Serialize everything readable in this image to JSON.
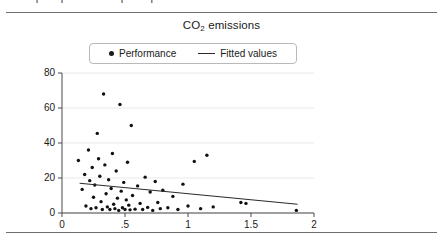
{
  "document": {
    "clipped_header_text": "· ·/ ·|2 · | · 2 · ·2    ·|2 - ·|2 · 2 · 2 2 · 4"
  },
  "chart_data": {
    "type": "scatter",
    "title": "CO2 emissions",
    "title_main": "CO",
    "title_sub": "2",
    "title_tail": " emissions",
    "xlabel": "",
    "ylabel": "",
    "xlim": [
      0,
      2
    ],
    "ylim": [
      0,
      80
    ],
    "grid": "horizontal",
    "legend_position": "top-center",
    "xticks": [
      0,
      0.5,
      1,
      1.5,
      2
    ],
    "xticklabels": [
      "0",
      ".5",
      "1",
      "1.5",
      "2"
    ],
    "yticks": [
      0,
      20,
      40,
      60,
      80
    ],
    "yticklabels": [
      "0",
      "20",
      "40",
      "60",
      "80"
    ],
    "series": [
      {
        "name": "Performance",
        "type": "scatter",
        "marker": "circle",
        "color": "#111111",
        "points": [
          [
            0.13,
            30.0
          ],
          [
            0.16,
            13.5
          ],
          [
            0.18,
            22.0
          ],
          [
            0.19,
            4.0
          ],
          [
            0.21,
            36.0
          ],
          [
            0.22,
            18.5
          ],
          [
            0.23,
            2.5
          ],
          [
            0.24,
            26.0
          ],
          [
            0.25,
            9.0
          ],
          [
            0.26,
            16.0
          ],
          [
            0.27,
            3.0
          ],
          [
            0.28,
            45.5
          ],
          [
            0.29,
            31.0
          ],
          [
            0.3,
            21.0
          ],
          [
            0.31,
            6.5
          ],
          [
            0.32,
            2.0
          ],
          [
            0.33,
            68.0
          ],
          [
            0.34,
            27.5
          ],
          [
            0.35,
            11.0
          ],
          [
            0.36,
            3.5
          ],
          [
            0.37,
            19.0
          ],
          [
            0.38,
            2.0
          ],
          [
            0.39,
            14.0
          ],
          [
            0.4,
            34.0
          ],
          [
            0.41,
            5.0
          ],
          [
            0.42,
            2.5
          ],
          [
            0.43,
            24.0
          ],
          [
            0.44,
            8.5
          ],
          [
            0.45,
            1.5
          ],
          [
            0.46,
            62.0
          ],
          [
            0.47,
            12.5
          ],
          [
            0.48,
            3.0
          ],
          [
            0.49,
            17.5
          ],
          [
            0.5,
            2.0
          ],
          [
            0.51,
            7.5
          ],
          [
            0.52,
            29.0
          ],
          [
            0.53,
            4.5
          ],
          [
            0.54,
            1.8
          ],
          [
            0.55,
            50.0
          ],
          [
            0.56,
            10.0
          ],
          [
            0.58,
            2.2
          ],
          [
            0.6,
            15.5
          ],
          [
            0.62,
            5.5
          ],
          [
            0.64,
            2.0
          ],
          [
            0.66,
            20.5
          ],
          [
            0.68,
            3.2
          ],
          [
            0.7,
            12.0
          ],
          [
            0.72,
            1.5
          ],
          [
            0.74,
            18.0
          ],
          [
            0.76,
            6.0
          ],
          [
            0.78,
            2.5
          ],
          [
            0.8,
            13.0
          ],
          [
            0.84,
            3.0
          ],
          [
            0.88,
            9.5
          ],
          [
            0.92,
            2.0
          ],
          [
            0.96,
            16.5
          ],
          [
            1.0,
            4.0
          ],
          [
            1.05,
            29.5
          ],
          [
            1.1,
            2.5
          ],
          [
            1.15,
            33.0
          ],
          [
            1.2,
            3.5
          ],
          [
            1.42,
            6.0
          ],
          [
            1.46,
            5.5
          ],
          [
            1.86,
            1.5
          ]
        ]
      },
      {
        "name": "Fitted values",
        "type": "line",
        "color": "#2b2b2b",
        "x_start": 0.14,
        "y_start": 17.0,
        "x_end": 1.87,
        "y_end": 5.0
      }
    ]
  },
  "legend": {
    "items": [
      {
        "label": "Performance",
        "marker": "dot"
      },
      {
        "label": "Fitted values",
        "marker": "line"
      }
    ]
  }
}
